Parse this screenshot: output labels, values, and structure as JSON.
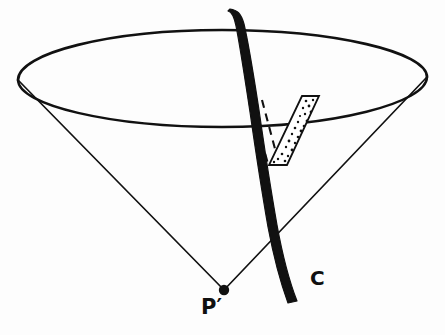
{
  "figure": {
    "background_color": "#fdfdfd",
    "ink_color": "#111111",
    "width": 445,
    "height": 335,
    "labels": [
      {
        "id": "apex-label",
        "text": "P′",
        "semantic": "cone-apex-point-label",
        "x": 201,
        "y": 297
      },
      {
        "id": "curve-label",
        "text": "C",
        "semantic": "curve-label",
        "x": 310,
        "y": 268
      }
    ],
    "elements": {
      "cone_rim": {
        "name": "cone-rim-ellipse",
        "center_x": 222,
        "center_y": 78,
        "radius_x": 205,
        "radius_y": 49,
        "stroke_color": "#111111",
        "stroke_width": 2.4
      },
      "cone_apex": {
        "name": "cone-apex-dot",
        "x": 224,
        "y": 290,
        "radius": 5,
        "fill": "#111111"
      },
      "cone_left_edge": {
        "name": "cone-left-generator-line",
        "x1": 18,
        "y1": 80,
        "x2": 224,
        "y2": 290,
        "stroke_width": 1.6
      },
      "cone_right_edge": {
        "name": "cone-right-generator-line",
        "x1": 427,
        "y1": 76,
        "x2": 224,
        "y2": 290,
        "stroke_width": 1.6
      },
      "curve_c": {
        "name": "thick-curve-c",
        "fill": "#111111",
        "description": "heavy black curve crossing the cone from top rim down past the right generator",
        "start_x": 232,
        "start_y": 10,
        "end_x": 298,
        "end_y": 300
      },
      "stippled_band": {
        "name": "stippled-band-region",
        "fill": "#ffffff",
        "stroke_color": "#111111",
        "stroke_width": 1.6,
        "dot_color": "#111111",
        "dot_count": 28,
        "corners": [
          [
            302,
            97
          ],
          [
            318,
            97
          ],
          [
            286,
            163
          ],
          [
            269,
            163
          ]
        ]
      },
      "dashed_lines": {
        "name": "dashed-projection-lines",
        "stroke_color": "#111111",
        "stroke_width": 2.0,
        "dash_pattern": "7 5",
        "lines": [
          {
            "x1": 250,
            "y1": 99,
            "x2": 268,
            "y2": 163
          },
          {
            "x1": 261,
            "y1": 99,
            "x2": 278,
            "y2": 163
          }
        ]
      }
    }
  }
}
